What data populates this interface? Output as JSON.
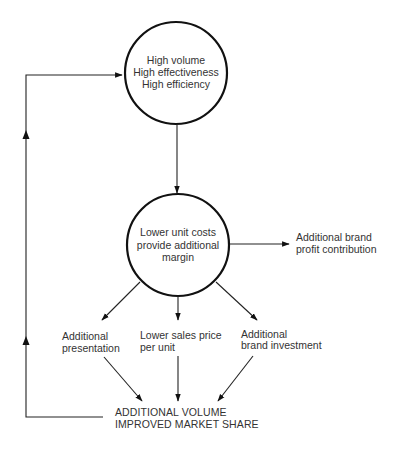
{
  "diagram": {
    "colors": {
      "line": "#222222",
      "text": "#333333",
      "background": "#ffffff"
    },
    "nodes": {
      "top_circle": {
        "lines": [
          "High volume",
          "High effectiveness",
          "High efficiency"
        ]
      },
      "middle_circle": {
        "lines": [
          "Lower unit costs",
          "provide additional",
          "margin"
        ]
      },
      "profit": {
        "lines": [
          "Additional brand",
          "profit contribution"
        ]
      },
      "presentation": {
        "lines": [
          "Additional",
          "presentation"
        ]
      },
      "price": {
        "lines": [
          "Lower sales price",
          "per unit"
        ]
      },
      "investment": {
        "lines": [
          "Additional",
          "brand investment"
        ]
      },
      "volume": {
        "lines": [
          "ADDITIONAL VOLUME",
          "IMPROVED MARKET SHARE"
        ]
      }
    },
    "edges": [
      {
        "from": "top_circle",
        "to": "middle_circle"
      },
      {
        "from": "middle_circle",
        "to": "profit"
      },
      {
        "from": "middle_circle",
        "to": "presentation"
      },
      {
        "from": "middle_circle",
        "to": "price"
      },
      {
        "from": "middle_circle",
        "to": "investment"
      },
      {
        "from": "presentation",
        "to": "volume"
      },
      {
        "from": "price",
        "to": "volume"
      },
      {
        "from": "investment",
        "to": "volume"
      },
      {
        "from": "volume",
        "to": "top_circle",
        "note": "feedback loop"
      }
    ]
  }
}
